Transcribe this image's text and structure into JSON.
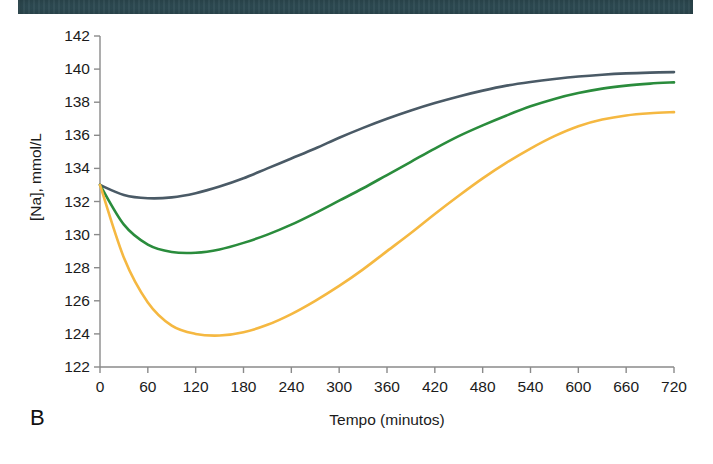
{
  "figure": {
    "panel_label": "B",
    "top_bar_color": "#2f4d55"
  },
  "caption": {
    "clipped_text": ""
  },
  "chart_data": {
    "type": "line",
    "title": "",
    "subtitle": "",
    "xlabel": "Tempo (minutos)",
    "ylabel": "[Na], mmol/L",
    "xlim": [
      0,
      720
    ],
    "ylim": [
      122,
      142
    ],
    "xticks": [
      0,
      60,
      120,
      180,
      240,
      300,
      360,
      420,
      480,
      540,
      600,
      660,
      720
    ],
    "yticks": [
      122,
      124,
      126,
      128,
      130,
      132,
      134,
      136,
      138,
      140,
      142
    ],
    "xtick_labels": [
      "0",
      "60",
      "120",
      "180",
      "240",
      "300",
      "360",
      "420",
      "480",
      "540",
      "600",
      "660",
      "720"
    ],
    "ytick_labels": [
      "122",
      "124",
      "126",
      "128",
      "130",
      "132",
      "134",
      "136",
      "138",
      "140",
      "142"
    ],
    "grid": false,
    "legend": "none",
    "x": [
      0,
      30,
      60,
      90,
      120,
      150,
      180,
      210,
      240,
      270,
      300,
      330,
      360,
      390,
      420,
      450,
      480,
      510,
      540,
      570,
      600,
      630,
      660,
      690,
      720
    ],
    "series": [
      {
        "name": "slate",
        "color": "#4a5a66",
        "values": [
          133.0,
          132.4,
          132.2,
          132.25,
          132.5,
          132.9,
          133.4,
          134.0,
          134.6,
          135.2,
          135.85,
          136.45,
          137.0,
          137.5,
          137.95,
          138.35,
          138.7,
          139.0,
          139.22,
          139.4,
          139.55,
          139.66,
          139.74,
          139.79,
          139.82
        ]
      },
      {
        "name": "green",
        "color": "#2a8c3c",
        "values": [
          133.0,
          130.6,
          129.4,
          128.95,
          128.9,
          129.1,
          129.5,
          130.0,
          130.6,
          131.3,
          132.05,
          132.8,
          133.6,
          134.4,
          135.2,
          135.95,
          136.6,
          137.2,
          137.75,
          138.2,
          138.55,
          138.82,
          139.0,
          139.12,
          139.2
        ]
      },
      {
        "name": "orange",
        "color": "#f5b841",
        "values": [
          133.0,
          128.6,
          125.9,
          124.5,
          124.0,
          123.9,
          124.1,
          124.55,
          125.2,
          126.0,
          126.9,
          127.9,
          129.0,
          130.1,
          131.25,
          132.35,
          133.4,
          134.35,
          135.2,
          135.95,
          136.55,
          136.95,
          137.2,
          137.33,
          137.4
        ]
      }
    ],
    "minima": [
      {
        "series": "slate",
        "x": 60,
        "y": 132.2
      },
      {
        "series": "green",
        "x": 105,
        "y": 128.9
      },
      {
        "series": "orange",
        "x": 140,
        "y": 123.9
      }
    ],
    "endpoints": [
      {
        "series": "slate",
        "x": 720,
        "y": 139.8
      },
      {
        "series": "green",
        "x": 720,
        "y": 139.2
      },
      {
        "series": "orange",
        "x": 720,
        "y": 137.4
      }
    ],
    "start_value": 133.0
  }
}
